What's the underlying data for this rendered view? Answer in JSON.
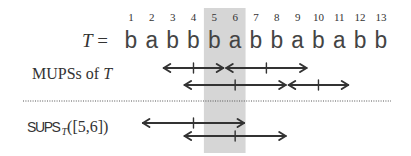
{
  "text_string": {
    "label_var": "T",
    "label_eq": " =",
    "indices": [
      "1",
      "2",
      "3",
      "4",
      "5",
      "6",
      "7",
      "8",
      "9",
      "10",
      "11",
      "12",
      "13"
    ],
    "characters": [
      "b",
      "a",
      "b",
      "b",
      "b",
      "a",
      "b",
      "b",
      "a",
      "b",
      "a",
      "b",
      "b"
    ]
  },
  "highlight": {
    "range": [
      5,
      6
    ],
    "color": "#d6d6d6"
  },
  "mupss": {
    "label_prefix": "MUPSs of ",
    "label_var": "T",
    "rows": [
      [
        [
          3,
          5
        ],
        [
          6,
          9
        ]
      ],
      [
        [
          4,
          8
        ],
        [
          9,
          11
        ]
      ]
    ]
  },
  "separator": {
    "style": "dotted",
    "color": "#555555"
  },
  "sups": {
    "label_fn": "SUPS",
    "label_sub": "T",
    "label_arg": "([5,6])",
    "rows": [
      [
        [
          2,
          6
        ]
      ],
      [
        [
          4,
          8
        ]
      ]
    ]
  },
  "colors": {
    "arrow": "#333333",
    "text": "#333333"
  }
}
